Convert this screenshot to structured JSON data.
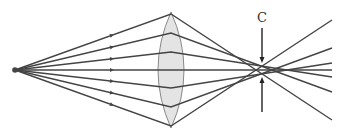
{
  "diagram": {
    "label_c": "C",
    "colors": {
      "ray": "#444444",
      "lens_fill": "#e4e4e4",
      "lens_stroke": "#888888",
      "source": "#444444",
      "background": "#ffffff"
    },
    "source": {
      "x": 15,
      "y": 70
    },
    "lens": {
      "cx": 171,
      "top": 12,
      "bottom": 128,
      "half_width": 13
    },
    "rays": [
      {
        "lens_y": 14,
        "end_x": 332,
        "end_y": 120
      },
      {
        "lens_y": 33,
        "end_x": 332,
        "end_y": 92
      },
      {
        "lens_y": 52,
        "end_x": 332,
        "end_y": 77
      },
      {
        "lens_y": 70,
        "end_x": 332,
        "end_y": 70
      },
      {
        "lens_y": 88,
        "end_x": 332,
        "end_y": 63
      },
      {
        "lens_y": 107,
        "end_x": 332,
        "end_y": 48
      },
      {
        "lens_y": 126,
        "end_x": 332,
        "end_y": 20
      }
    ],
    "arrow_x": 112,
    "pointer": {
      "x": 262,
      "top_from": 28,
      "top_to": 63,
      "bottom_from": 112,
      "bottom_to": 77
    }
  }
}
